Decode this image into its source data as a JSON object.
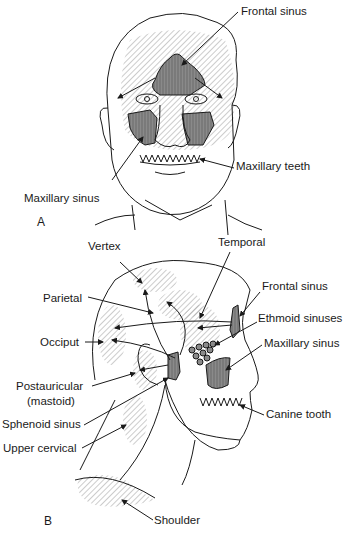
{
  "figure": {
    "panel_a": {
      "letter": "A",
      "labels": {
        "frontal_sinus": "Frontal sinus",
        "maxillary_teeth": "Maxillary teeth",
        "maxillary_sinus": "Maxillary sinus"
      }
    },
    "panel_b": {
      "letter": "B",
      "labels": {
        "vertex": "Vertex",
        "temporal": "Temporal",
        "parietal": "Parietal",
        "frontal_sinus": "Frontal sinus",
        "ethmoid_sinuses": "Ethmoid sinuses",
        "occiput": "Occiput",
        "maxillary_sinus": "Maxillary sinus",
        "postauricular": "Postauricular",
        "mastoid": "(mastoid)",
        "sphenoid_sinus": "Sphenoid sinus",
        "canine_tooth": "Canine tooth",
        "upper_cervical": "Upper cervical",
        "shoulder": "Shoulder"
      }
    },
    "colors": {
      "line": "#1a1a1a",
      "sinus_fill": "#7a7a7a",
      "hatch": "#9a9a9a"
    }
  }
}
